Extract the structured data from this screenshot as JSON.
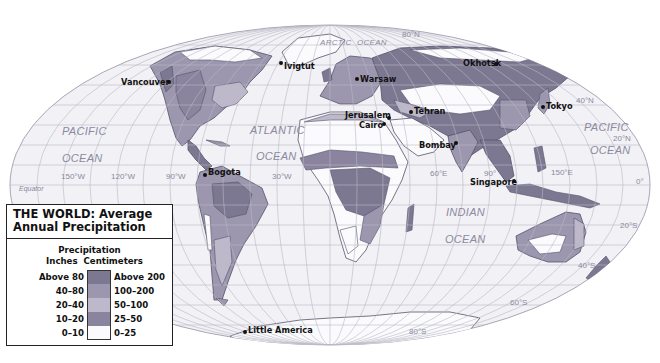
{
  "map": {
    "title": "THE WORLD: Average Annual Precipitation",
    "title_line1": "THE WORLD: Average",
    "title_line2": "Annual Precipitation",
    "projection": "elliptical (Mollweide-style)",
    "colors": {
      "ocean": "#f2f1f5",
      "graticule": "#b9b8c6",
      "coast": "#55536a",
      "above_80": "#7d7891",
      "40_80": "#9c97ae",
      "20_40": "#bdb9cb",
      "10_20": "#8a849e",
      "0_10": "#fbfbfd"
    }
  },
  "legend": {
    "heading": "Precipitation",
    "col_inches": "Inches",
    "col_cm": "Centimeters",
    "classes": [
      {
        "inches": "Above 80",
        "cm": "Above 200",
        "color": "#7d7891"
      },
      {
        "inches": "40–80",
        "cm": "100–200",
        "color": "#9c97ae"
      },
      {
        "inches": "20–40",
        "cm": "50–100",
        "color": "#bdb9cb"
      },
      {
        "inches": "10–20",
        "cm": "25–50",
        "color": "#8a849e"
      },
      {
        "inches": "0–10",
        "cm": "0–25",
        "color": "#fbfbfd"
      }
    ]
  },
  "oceans": [
    {
      "name": "PACIFIC",
      "x": 62,
      "y": 135
    },
    {
      "name": "OCEAN",
      "x": 62,
      "y": 162
    },
    {
      "name": "ATLANTIC",
      "x": 250,
      "y": 134
    },
    {
      "name": "OCEAN",
      "x": 256,
      "y": 160
    },
    {
      "name": "ARCTIC",
      "x": 320,
      "y": 45
    },
    {
      "name": "OCEAN",
      "x": 357,
      "y": 45
    },
    {
      "name": "INDIAN",
      "x": 446,
      "y": 216
    },
    {
      "name": "OCEAN",
      "x": 445,
      "y": 243
    },
    {
      "name": "PACIFIC",
      "x": 584,
      "y": 131
    },
    {
      "name": "OCEAN",
      "x": 590,
      "y": 154
    }
  ],
  "graticule_labels": [
    {
      "text": "80°N",
      "x": 402,
      "y": 37
    },
    {
      "text": "40°N",
      "x": 576,
      "y": 103
    },
    {
      "text": "20°N",
      "x": 613,
      "y": 141
    },
    {
      "text": "150°W",
      "x": 61,
      "y": 179
    },
    {
      "text": "120°W",
      "x": 111,
      "y": 179
    },
    {
      "text": "90°W",
      "x": 166,
      "y": 179
    },
    {
      "text": "30°W",
      "x": 272,
      "y": 179
    },
    {
      "text": "60°E",
      "x": 430,
      "y": 176
    },
    {
      "text": "90°",
      "x": 484,
      "y": 176
    },
    {
      "text": "150°E",
      "x": 551,
      "y": 175
    },
    {
      "text": "0°",
      "x": 636,
      "y": 184
    },
    {
      "text": "Equator",
      "x": 19,
      "y": 191
    },
    {
      "text": "20°S",
      "x": 620,
      "y": 228
    },
    {
      "text": "40°S",
      "x": 578,
      "y": 268
    },
    {
      "text": "60°S",
      "x": 510,
      "y": 305
    },
    {
      "text": "80°S",
      "x": 409,
      "y": 334
    }
  ],
  "cities": [
    {
      "name": "Vancouver",
      "dot_x": 169,
      "dot_y": 82,
      "label_x": 121,
      "label_y": 85
    },
    {
      "name": "Ivigtut",
      "dot_x": 281,
      "dot_y": 63,
      "label_x": 284,
      "label_y": 69
    },
    {
      "name": "Warsaw",
      "dot_x": 357,
      "dot_y": 79,
      "label_x": 360,
      "label_y": 82
    },
    {
      "name": "Okhotsk",
      "dot_x": 496,
      "dot_y": 64,
      "label_x": 463,
      "label_y": 66
    },
    {
      "name": "Tokyo",
      "dot_x": 543,
      "dot_y": 107,
      "label_x": 546,
      "label_y": 109
    },
    {
      "name": "Tehran",
      "dot_x": 411,
      "dot_y": 112,
      "label_x": 414,
      "label_y": 114
    },
    {
      "name": "Jerusalem",
      "dot_x": 389,
      "dot_y": 118,
      "label_x": 345,
      "label_y": 118
    },
    {
      "name": "Cairo",
      "dot_x": 384,
      "dot_y": 124,
      "label_x": 359,
      "label_y": 128
    },
    {
      "name": "Bombay",
      "dot_x": 456,
      "dot_y": 143,
      "label_x": 419,
      "label_y": 148
    },
    {
      "name": "Singapore",
      "dot_x": 514,
      "dot_y": 181,
      "label_x": 470,
      "label_y": 185
    },
    {
      "name": "Bogota",
      "dot_x": 205,
      "dot_y": 175,
      "label_x": 208,
      "label_y": 175
    },
    {
      "name": "Little America",
      "dot_x": 245,
      "dot_y": 332,
      "label_x": 248,
      "label_y": 333
    }
  ]
}
